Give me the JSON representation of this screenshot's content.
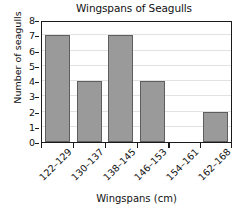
{
  "chart_data": {
    "type": "bar",
    "title": "Wingspans of Seagulls",
    "xlabel": "Wingspans (cm)",
    "ylabel": "Number of seagulls",
    "categories": [
      "122–129",
      "130–137",
      "138–145",
      "146–153",
      "154–161",
      "162–168"
    ],
    "values": [
      7,
      4,
      7,
      4,
      0,
      2
    ],
    "ylim": [
      0,
      8
    ],
    "ytick_labels": [
      "0",
      "1",
      "2",
      "3",
      "4",
      "5",
      "6",
      "7",
      "8"
    ],
    "ytick_values": [
      0,
      1,
      2,
      3,
      4,
      5,
      6,
      7,
      8
    ],
    "grid": true,
    "grid_axis": "y",
    "legend": false,
    "bar_color": "#9a9a9a",
    "bar_edge_color": "#5e5e5e",
    "grid_color": "#e2e2e2",
    "axis_color": "#1a1a1a",
    "background": "#ffffff"
  }
}
